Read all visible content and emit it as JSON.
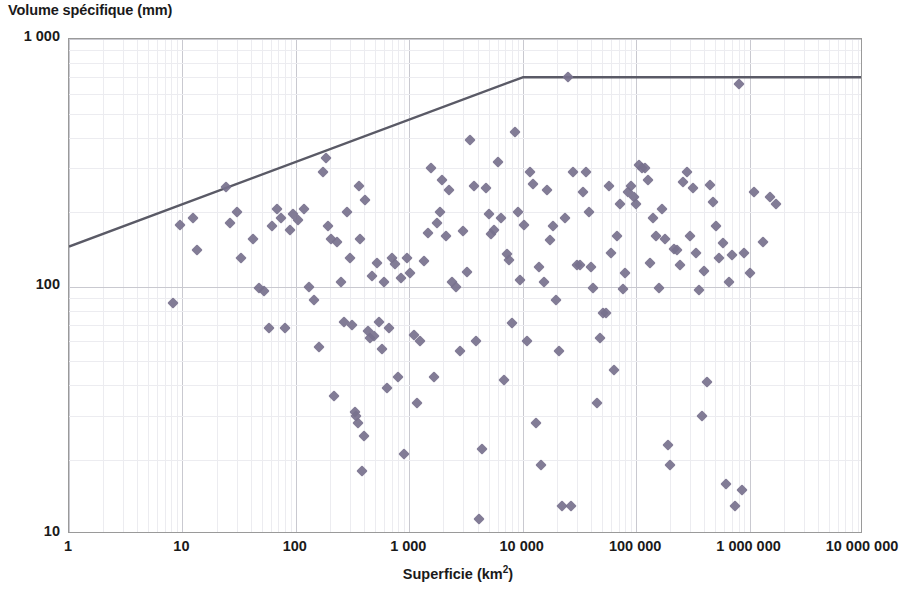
{
  "chart_data": {
    "type": "scatter",
    "title": "",
    "xlabel": "Superficie (km2)",
    "xlabel_base": "Superficie (km",
    "xlabel_sup": "2",
    "xlabel_tail": ")",
    "ylabel": "Volume spécifique (mm)",
    "x_scale": "log",
    "y_scale": "log",
    "xlim": [
      1,
      10000000
    ],
    "ylim": [
      10,
      1000
    ],
    "grid": true,
    "legend": null,
    "xticks": [
      "1",
      "10",
      "100",
      "1 000",
      "10 000",
      "100 000",
      "1 000 000",
      "10 000 000"
    ],
    "xtick_values": [
      1,
      10,
      100,
      1000,
      10000,
      100000,
      1000000,
      10000000
    ],
    "yticks": [
      "10",
      "100",
      "1 000"
    ],
    "ytick_values": [
      10,
      100,
      1000
    ],
    "marker_color": "#77718d",
    "line_color": "#5a5a66",
    "grid_color": "#c9c9d0",
    "axis_color": "#9a9a9a",
    "series": [
      {
        "name": "Envelope",
        "type": "line",
        "color": "#5a5a66",
        "points": [
          [
            1,
            145
          ],
          [
            10000,
            700
          ],
          [
            10000000,
            700
          ]
        ]
      },
      {
        "name": "Bassins versants",
        "type": "scatter",
        "color": "#77718d",
        "points": [
          [
            8.2,
            86
          ],
          [
            9.5,
            178
          ],
          [
            12.5,
            190
          ],
          [
            13.5,
            140
          ],
          [
            24,
            253
          ],
          [
            26,
            180
          ],
          [
            30,
            200
          ],
          [
            33,
            130
          ],
          [
            42,
            155
          ],
          [
            47,
            99
          ],
          [
            52,
            96
          ],
          [
            58,
            68
          ],
          [
            62,
            175
          ],
          [
            68,
            205
          ],
          [
            74,
            190
          ],
          [
            80,
            68
          ],
          [
            88,
            170
          ],
          [
            95,
            196
          ],
          [
            105,
            185
          ],
          [
            118,
            205
          ],
          [
            130,
            100
          ],
          [
            145,
            88
          ],
          [
            160,
            57
          ],
          [
            175,
            290
          ],
          [
            185,
            330
          ],
          [
            190,
            175
          ],
          [
            205,
            155
          ],
          [
            215,
            36
          ],
          [
            230,
            152
          ],
          [
            250,
            104
          ],
          [
            265,
            72
          ],
          [
            280,
            200
          ],
          [
            300,
            131
          ],
          [
            315,
            70
          ],
          [
            330,
            31
          ],
          [
            340,
            30
          ],
          [
            350,
            28
          ],
          [
            360,
            255
          ],
          [
            370,
            155
          ],
          [
            380,
            18
          ],
          [
            395,
            25
          ],
          [
            410,
            224
          ],
          [
            430,
            66
          ],
          [
            450,
            62
          ],
          [
            470,
            110
          ],
          [
            490,
            63
          ],
          [
            520,
            125
          ],
          [
            545,
            72
          ],
          [
            570,
            56
          ],
          [
            600,
            104
          ],
          [
            630,
            39
          ],
          [
            660,
            68
          ],
          [
            700,
            130
          ],
          [
            740,
            123
          ],
          [
            790,
            43
          ],
          [
            840,
            108
          ],
          [
            900,
            21
          ],
          [
            960,
            131
          ],
          [
            1020,
            113
          ],
          [
            1100,
            64
          ],
          [
            1180,
            34
          ],
          [
            1250,
            60
          ],
          [
            1350,
            127
          ],
          [
            1450,
            165
          ],
          [
            1550,
            300
          ],
          [
            1650,
            43
          ],
          [
            1750,
            181
          ],
          [
            1850,
            200
          ],
          [
            1950,
            270
          ],
          [
            2100,
            160
          ],
          [
            2250,
            245
          ],
          [
            2400,
            104
          ],
          [
            2600,
            100
          ],
          [
            2800,
            55
          ],
          [
            3000,
            168
          ],
          [
            3200,
            114
          ],
          [
            3450,
            390
          ],
          [
            3700,
            255
          ],
          [
            3900,
            60
          ],
          [
            4100,
            11.5
          ],
          [
            4400,
            22
          ],
          [
            4700,
            250
          ],
          [
            5000,
            196
          ],
          [
            5300,
            163
          ],
          [
            5600,
            170
          ],
          [
            6000,
            320
          ],
          [
            6400,
            190
          ],
          [
            6800,
            42
          ],
          [
            7200,
            135
          ],
          [
            7600,
            128
          ],
          [
            8000,
            71
          ],
          [
            8500,
            420
          ],
          [
            9000,
            200
          ],
          [
            9500,
            106
          ],
          [
            10200,
            178
          ],
          [
            10800,
            60
          ],
          [
            11500,
            290
          ],
          [
            12200,
            260
          ],
          [
            13000,
            28
          ],
          [
            13800,
            120
          ],
          [
            14600,
            19
          ],
          [
            15500,
            104
          ],
          [
            16500,
            245
          ],
          [
            17500,
            154
          ],
          [
            18500,
            175
          ],
          [
            19600,
            88
          ],
          [
            21000,
            55
          ],
          [
            22000,
            13
          ],
          [
            23500,
            190
          ],
          [
            25000,
            700
          ],
          [
            26500,
            13
          ],
          [
            28000,
            290
          ],
          [
            30000,
            122
          ],
          [
            32000,
            122
          ],
          [
            34000,
            240
          ],
          [
            36000,
            290
          ],
          [
            38000,
            200
          ],
          [
            40000,
            120
          ],
          [
            42000,
            99
          ],
          [
            45000,
            34
          ],
          [
            48000,
            62
          ],
          [
            51000,
            78
          ],
          [
            54000,
            78
          ],
          [
            57000,
            255
          ],
          [
            60000,
            136
          ],
          [
            64000,
            46
          ],
          [
            68000,
            160
          ],
          [
            72000,
            215
          ],
          [
            76000,
            98
          ],
          [
            80000,
            113
          ],
          [
            85000,
            240
          ],
          [
            90000,
            255
          ],
          [
            95000,
            230
          ],
          [
            100000,
            215
          ],
          [
            105000,
            310
          ],
          [
            112000,
            300
          ],
          [
            119000,
            300
          ],
          [
            126000,
            270
          ],
          [
            133000,
            124
          ],
          [
            141000,
            190
          ],
          [
            150000,
            160
          ],
          [
            160000,
            99
          ],
          [
            170000,
            206
          ],
          [
            180000,
            155
          ],
          [
            190000,
            23
          ],
          [
            200000,
            19
          ],
          [
            215000,
            142
          ],
          [
            230000,
            140
          ],
          [
            245000,
            122
          ],
          [
            260000,
            265
          ],
          [
            280000,
            290
          ],
          [
            300000,
            160
          ],
          [
            320000,
            250
          ],
          [
            340000,
            137
          ],
          [
            360000,
            97
          ],
          [
            380000,
            30
          ],
          [
            400000,
            116
          ],
          [
            420000,
            41
          ],
          [
            450000,
            258
          ],
          [
            480000,
            220
          ],
          [
            510000,
            175
          ],
          [
            540000,
            130
          ],
          [
            580000,
            150
          ],
          [
            620000,
            16
          ],
          [
            660000,
            104
          ],
          [
            700000,
            134
          ],
          [
            750000,
            13
          ],
          [
            800000,
            660
          ],
          [
            850000,
            15
          ],
          [
            900000,
            136
          ],
          [
            1000000,
            113
          ],
          [
            1100000,
            240
          ],
          [
            1300000,
            152
          ],
          [
            1500000,
            230
          ],
          [
            1700000,
            215
          ]
        ]
      }
    ]
  }
}
